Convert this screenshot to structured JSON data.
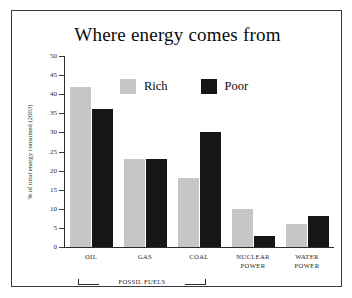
{
  "chart_data": {
    "type": "bar",
    "title": "Where energy comes from",
    "xlabel": "",
    "ylabel": "% of total energy consumed (2003)",
    "ylim": [
      0,
      50
    ],
    "yticks": [
      0,
      5,
      10,
      15,
      20,
      25,
      30,
      35,
      40,
      45,
      50
    ],
    "grid": false,
    "legend_position": "top-center",
    "categories": [
      "OIL",
      "GAS",
      "COAL",
      "NUCLEAR POWER",
      "WATER POWER"
    ],
    "category_lines": [
      [
        "OIL"
      ],
      [
        "GAS"
      ],
      [
        "COAL"
      ],
      [
        "NUCLEAR",
        "POWER"
      ],
      [
        "WATER",
        "POWER"
      ]
    ],
    "series": [
      {
        "name": "Rich",
        "color": "#c6c6c6",
        "values": [
          42,
          23,
          18,
          10,
          6
        ]
      },
      {
        "name": "Poor",
        "color": "#161616",
        "values": [
          36,
          23,
          30,
          3,
          8
        ]
      }
    ],
    "annotations": [
      {
        "text": "FOSSIL FUELS",
        "spans": [
          "OIL",
          "GAS",
          "COAL"
        ]
      }
    ]
  },
  "colors": {
    "rich": "#c6c6c6",
    "poor": "#161616",
    "axis": "#2b2b2b",
    "frame": "#3a3a3a",
    "text": "#0c0c0c",
    "background": "#ffffff"
  }
}
